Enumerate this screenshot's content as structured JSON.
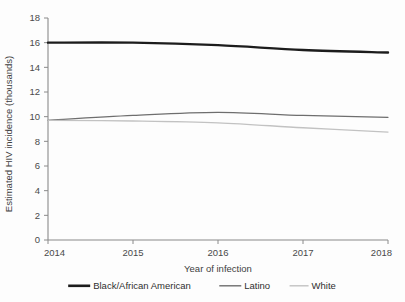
{
  "chart_data": {
    "type": "line",
    "title": "",
    "xlabel": "Year of infection",
    "ylabel": "Estimated HIV incidence (thousands)",
    "x": [
      2014,
      2015,
      2016,
      2017,
      2018
    ],
    "xlim": [
      2014,
      2018
    ],
    "ylim": [
      0,
      18
    ],
    "ytick_step": 2,
    "grid": false,
    "legend_position": "bottom",
    "xticks": [
      "2014",
      "2015",
      "2016",
      "2017",
      "2018"
    ],
    "yticks": [
      "0",
      "2",
      "4",
      "6",
      "8",
      "10",
      "12",
      "14",
      "16",
      "18"
    ],
    "series": [
      {
        "name": "Black/African American",
        "color": "#1c1c1c",
        "width": 2.4,
        "values": [
          16.0,
          16.0,
          15.8,
          15.4,
          15.2
        ]
      },
      {
        "name": "Latino",
        "color": "#6e6e6e",
        "width": 1.3,
        "values": [
          9.7,
          10.1,
          10.35,
          10.1,
          9.95
        ]
      },
      {
        "name": "White",
        "color": "#c2c2c2",
        "width": 1.3,
        "values": [
          9.7,
          9.65,
          9.5,
          9.1,
          8.75
        ]
      }
    ]
  },
  "legend": {
    "items": [
      {
        "label": "Black/African American",
        "color": "#1c1c1c",
        "width": 2.6
      },
      {
        "label": "Latino",
        "color": "#6e6e6e",
        "width": 1.4
      },
      {
        "label": "White",
        "color": "#c2c2c2",
        "width": 1.4
      }
    ]
  },
  "axes": {
    "x_title": "Year of infection",
    "y_title": "Estimated HIV incidence (thousands)"
  }
}
